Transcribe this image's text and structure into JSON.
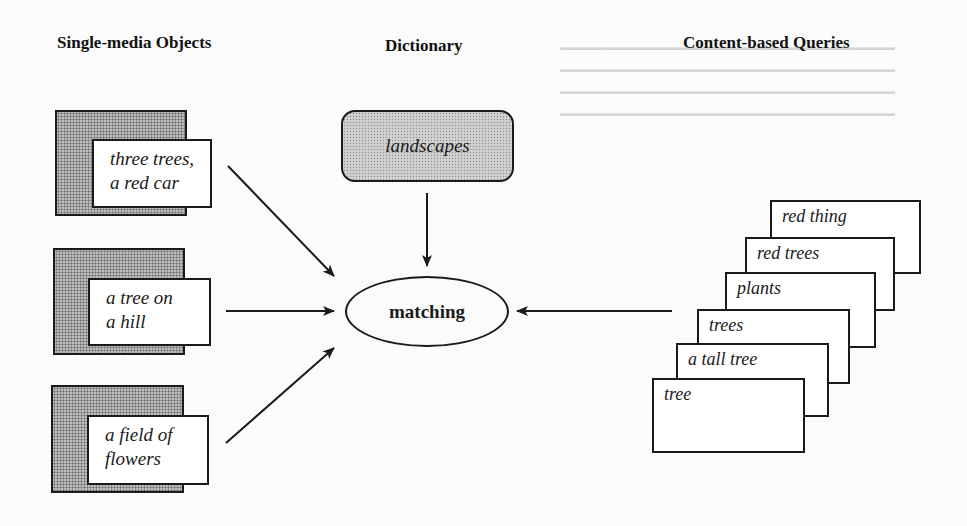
{
  "headings": {
    "single_media_objects": "Single-media Objects",
    "dictionary": "Dictionary",
    "content_based_queries": "Content-based Queries"
  },
  "single_media_objects": [
    {
      "lines": [
        "three trees,",
        "a red car"
      ]
    },
    {
      "lines": [
        "a tree on",
        "a hill"
      ]
    },
    {
      "lines": [
        "a field of",
        "flowers"
      ]
    }
  ],
  "dictionary": {
    "term": "landscapes"
  },
  "matching": {
    "label": "matching"
  },
  "content_based_queries": [
    {
      "label": "red thing"
    },
    {
      "label": "red trees"
    },
    {
      "label": "plants"
    },
    {
      "label": "trees"
    },
    {
      "label": "a tall tree"
    },
    {
      "label": "tree"
    }
  ],
  "colors": {
    "ink": "#1a1a1a",
    "background": "#fbfbfb",
    "stipple_dark": "#a9a9a9",
    "stipple_light": "#c9c9c9"
  }
}
